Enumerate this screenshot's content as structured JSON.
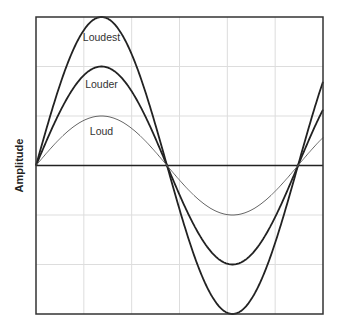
{
  "chart_data": {
    "type": "line",
    "title": "",
    "xlabel": "",
    "ylabel": "Amplitude",
    "grid": true,
    "grid_columns": 6,
    "grid_rows": 6,
    "ylim": [
      -3,
      3
    ],
    "xlim": [
      0,
      1.096
    ],
    "x_unit": "cycles",
    "legend_position": "inline labels above each curve peak",
    "function": "sine",
    "series": [
      {
        "name": "Loudest",
        "amplitude": 3,
        "cycles": 1.096,
        "label_x": 0.25,
        "label_y": 2.6,
        "stroke": "#222222",
        "width": 1.8
      },
      {
        "name": "Louder",
        "amplitude": 2,
        "cycles": 1.096,
        "label_x": 0.25,
        "label_y": 1.65,
        "stroke": "#222222",
        "width": 1.8
      },
      {
        "name": "Loud",
        "amplitude": 1,
        "cycles": 1.096,
        "label_x": 0.25,
        "label_y": 0.7,
        "stroke": "#666666",
        "width": 1
      }
    ]
  },
  "colors": {
    "border": "#333333",
    "grid": "#dddddd",
    "zero_line": "#222222"
  },
  "layout": {
    "plot_left": 36,
    "plot_top": 17,
    "plot_right": 323,
    "plot_bottom": 314,
    "wave_start_x": 36,
    "period_px": 262
  }
}
